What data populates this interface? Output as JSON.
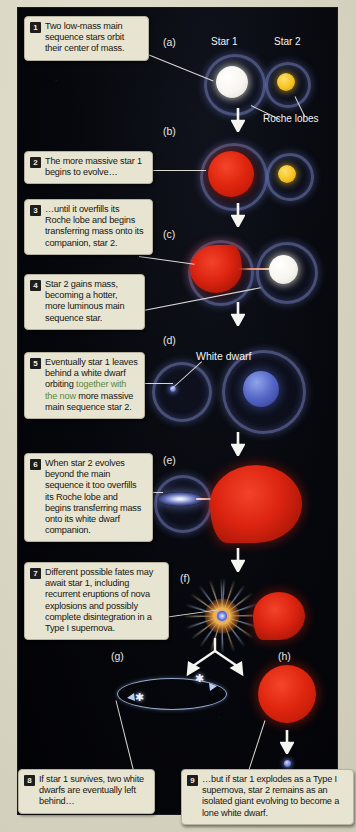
{
  "figure": {
    "background_color": "#d8d5c4",
    "panel_color": "#06070c",
    "callout_color": "#e8e4d2",
    "accent_green": "#5d8a3a"
  },
  "scene_labels": {
    "star1": "Star 1",
    "star2": "Star 2",
    "roche_lobes": "Roche lobes",
    "white_dwarf": "White dwarf"
  },
  "panel_labels": {
    "a": "(a)",
    "b": "(b)",
    "c": "(c)",
    "d": "(d)",
    "e": "(e)",
    "f": "(f)",
    "g": "(g)",
    "h": "(h)"
  },
  "callouts": [
    {
      "num": "1",
      "text": "Two low-mass main sequence stars orbit their center of mass."
    },
    {
      "num": "2",
      "text": "The more massive star 1 begins to evolve…"
    },
    {
      "num": "3",
      "text": "…until it overfills its Roche lobe and begins transferring mass onto its companion, star 2."
    },
    {
      "num": "4",
      "text": "Star 2 gains mass, becoming a hotter, more luminous main sequence star."
    },
    {
      "num": "5",
      "text_before": "Eventually star 1 leaves behind a white dwarf orbiting ",
      "text_highlight": "together with the now",
      "text_after": " more massive main sequence star 2."
    },
    {
      "num": "6",
      "text": "When star 2 evolves beyond the main sequence it too overfills its Roche lobe and begins transferring mass onto its white dwarf companion."
    },
    {
      "num": "7",
      "text": "Different possible fates may await star 1, including recurrent eruptions of nova explosions and possibly complete disintegration in a Type I supernova."
    },
    {
      "num": "8",
      "text": "If star 1 survives, two white dwarfs are eventually left behind…"
    },
    {
      "num": "9",
      "text": "…but if star 1 explodes as a Type I supernova, star 2 remains as an isolated giant evolving to become a lone white dwarf."
    }
  ]
}
